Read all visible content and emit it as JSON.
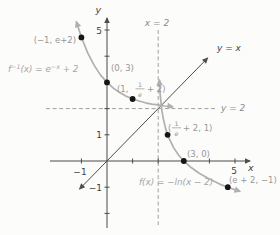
{
  "figure": {
    "background": "#fcfcfa",
    "colors": {
      "axis": "#4a4a4a",
      "curve": "#b0b0b0",
      "identity_line": "#4d4d4d",
      "dashed": "#a0a0a0",
      "label_gray": "#979797",
      "label_light": "#a6a6a6",
      "label_dark": "#3f3f3f",
      "point_dot": "#161616"
    }
  },
  "labels": {
    "x_axis": "x",
    "y_axis": "y",
    "identity": "y = x",
    "x_asymptote": "x = 2",
    "y_asymptote": "y = 2",
    "f_label": "f(x) = −ln(x − 2)",
    "finv": {
      "p1": "f",
      "sup1": "−1",
      "p2": "(x) = e",
      "sup2": "−x",
      "p3": " + 2"
    },
    "pt_neg1_e2": "(−1, e+2)",
    "pt_0_3": "(0, 3)",
    "pt_1_inve": {
      "pre": "(1,",
      "num": "1",
      "den": "e",
      "post": "+ 2)"
    },
    "pt_inve_1": {
      "pre": "(",
      "num": "1",
      "den": "e",
      "post": "+ 2, 1)"
    },
    "pt_3_0": "(3, 0)",
    "pt_e2_neg1": "(e + 2, −1)"
  },
  "ticks": {
    "y5": "5",
    "y1": "1",
    "ym1": "−1",
    "xm1": "−1",
    "x5": "5"
  },
  "chart_data": {
    "type": "line",
    "xlabel": "x",
    "ylabel": "y",
    "xlim": [
      -2.2,
      5.8
    ],
    "ylim": [
      -2.8,
      5.6
    ],
    "x_ticks": [
      -1,
      1,
      2,
      3,
      4,
      5
    ],
    "y_ticks": [
      -2,
      -1,
      1,
      2,
      3,
      4,
      5
    ],
    "x_tick_labels_shown": [
      "-1",
      "5"
    ],
    "y_tick_labels_shown": [
      "5",
      "1",
      "-1"
    ],
    "grid": false,
    "legend_position": "none",
    "asymptotes": {
      "vertical_x": 2,
      "horizontal_y": 2
    },
    "series": [
      {
        "name": "f_inverse",
        "equation": "f^-1(x) = e^-x + 2",
        "style": "solid gray, arrows both ends",
        "samples": [
          [
            -1.2,
            5.32
          ],
          [
            -1,
            4.72
          ],
          [
            -0.75,
            4.12
          ],
          [
            -0.5,
            3.65
          ],
          [
            -0.25,
            3.28
          ],
          [
            0,
            3
          ],
          [
            0.25,
            2.78
          ],
          [
            0.5,
            2.61
          ],
          [
            0.75,
            2.47
          ],
          [
            1,
            2.37
          ],
          [
            1.25,
            2.29
          ],
          [
            1.5,
            2.22
          ],
          [
            1.75,
            2.17
          ],
          [
            2,
            2.14
          ],
          [
            2.25,
            2.1
          ],
          [
            2.5,
            2.08
          ],
          [
            2.58,
            2.07
          ]
        ]
      },
      {
        "name": "f",
        "equation": "f(x) = -ln(x - 2)",
        "style": "solid gray, arrows both ends",
        "samples": [
          [
            2.045,
            3.1
          ],
          [
            2.06,
            2.81
          ],
          [
            2.08,
            2.53
          ],
          [
            2.1,
            2.3
          ],
          [
            2.15,
            1.9
          ],
          [
            2.2,
            1.61
          ],
          [
            2.3,
            1.2
          ],
          [
            2.4,
            0.92
          ],
          [
            2.6,
            0.51
          ],
          [
            2.8,
            0.22
          ],
          [
            3,
            0
          ],
          [
            3.3,
            -0.26
          ],
          [
            3.6,
            -0.47
          ],
          [
            4,
            -0.69
          ],
          [
            4.4,
            -0.88
          ],
          [
            4.8,
            -1.03
          ],
          [
            5.2,
            -1.16
          ]
        ]
      },
      {
        "name": "identity",
        "equation": "y = x",
        "style": "solid dark, arrows both ends",
        "samples": [
          [
            -1.07,
            -1.07
          ],
          [
            3.93,
            3.93
          ]
        ]
      }
    ],
    "labeled_points": [
      {
        "label": "(-1, e+2)",
        "x": -1,
        "y": 4.718
      },
      {
        "label": "(0, 3)",
        "x": 0,
        "y": 3
      },
      {
        "label": "(1, 1/e + 2)",
        "x": 1,
        "y": 2.368
      },
      {
        "label": "(1/e + 2, 1)",
        "x": 2.368,
        "y": 1
      },
      {
        "label": "(3, 0)",
        "x": 3,
        "y": 0
      },
      {
        "label": "(e + 2, -1)",
        "x": 4.718,
        "y": -1
      }
    ]
  }
}
